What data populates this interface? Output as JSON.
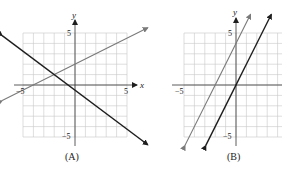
{
  "chart_data": [
    {
      "type": "line",
      "title": "(A)",
      "xlabel": "x",
      "ylabel": "y",
      "xlim": [
        -5,
        5
      ],
      "ylim": [
        -5,
        5
      ],
      "grid": true,
      "tick_labels": {
        "x": [
          "-5",
          "5"
        ],
        "y": [
          "5",
          "-5"
        ]
      },
      "series": [
        {
          "name": "gray line",
          "color": "#7a7a7a",
          "slope": 0.5,
          "intercept": 2,
          "x": [
            -7,
            7
          ],
          "y": [
            -1.5,
            5.5
          ]
        },
        {
          "name": "black line",
          "color": "#1e1e1e",
          "slope": -0.75,
          "intercept": -0.5,
          "x": [
            -7,
            7
          ],
          "y": [
            4.75,
            -5.75
          ]
        }
      ]
    },
    {
      "type": "line",
      "title": "(B)",
      "xlabel": "",
      "ylabel": "y",
      "xlim": [
        -5,
        5
      ],
      "ylim": [
        -5,
        5
      ],
      "grid": true,
      "tick_labels": {
        "x": [
          "-5"
        ],
        "y": [
          "5",
          "-5"
        ]
      },
      "series": [
        {
          "name": "gray line",
          "color": "#7a7a7a",
          "slope": 2,
          "intercept": 4,
          "x": [
            -4.9,
            1.4
          ],
          "y": [
            -5.8,
            6.8
          ]
        },
        {
          "name": "black line",
          "color": "#1e1e1e",
          "slope": 2,
          "intercept": 0,
          "x": [
            -2.9,
            3.4
          ],
          "y": [
            -5.8,
            6.8
          ]
        }
      ]
    }
  ],
  "labels": {
    "a": {
      "caption": "(A)",
      "x_axis": "x",
      "y_axis": "y",
      "x_neg": "−5",
      "x_pos": "5",
      "y_pos": "5",
      "y_neg": "−5"
    },
    "b": {
      "caption": "(B)",
      "y_axis": "y",
      "x_neg": "−5",
      "y_pos": "5",
      "y_neg": "−5"
    }
  }
}
